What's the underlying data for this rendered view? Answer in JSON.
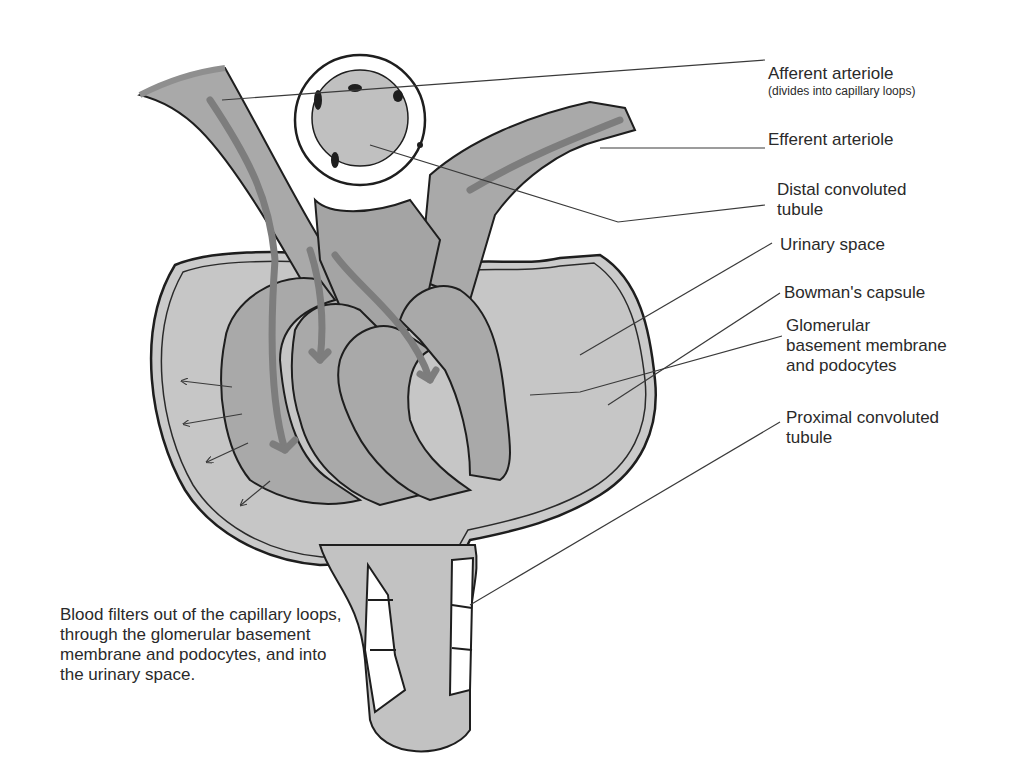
{
  "diagram": {
    "colors": {
      "background": "#ffffff",
      "capsule_fill": "#c8c8c8",
      "vessel_fill": "#a8a8a8",
      "flow_arrow": "#7d7d7d",
      "outline": "#1e1e1e",
      "leader_line": "#3a3a3a"
    },
    "labels": [
      {
        "id": "afferent",
        "text": "Afferent arteriole",
        "subtext": "(divides into capillary loops)"
      },
      {
        "id": "efferent",
        "text": "Efferent arteriole"
      },
      {
        "id": "distal",
        "text": "Distal convoluted\ntubule"
      },
      {
        "id": "urinary",
        "text": "Urinary space"
      },
      {
        "id": "bowman",
        "text": "Bowman's capsule"
      },
      {
        "id": "gbm",
        "text": "Glomerular\nbasement membrane\nand podocytes"
      },
      {
        "id": "proximal",
        "text": "Proximal convoluted\ntubule"
      }
    ],
    "caption": "Blood filters out of the capillary loops, through the glomerular basement membrane and podocytes, and into the urinary space."
  }
}
